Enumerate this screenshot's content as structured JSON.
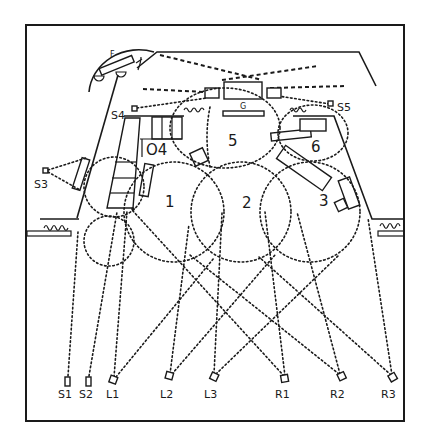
{
  "diagram": {
    "type": "stage lighting plot",
    "areas": [
      {
        "id": "1",
        "label": "1"
      },
      {
        "id": "2",
        "label": "2"
      },
      {
        "id": "3",
        "label": "3"
      },
      {
        "id": "4",
        "label": "O4"
      },
      {
        "id": "5",
        "label": "5"
      },
      {
        "id": "6",
        "label": "6"
      }
    ],
    "scenery_labels": {
      "F": "F",
      "G": "G"
    },
    "instruments": [
      {
        "id": "S1",
        "label": "S1"
      },
      {
        "id": "S2",
        "label": "S2"
      },
      {
        "id": "L1",
        "label": "L1"
      },
      {
        "id": "L2",
        "label": "L2"
      },
      {
        "id": "L3",
        "label": "L3"
      },
      {
        "id": "R1",
        "label": "R1"
      },
      {
        "id": "R2",
        "label": "R2"
      },
      {
        "id": "R3",
        "label": "R3"
      },
      {
        "id": "S3",
        "label": "S3"
      },
      {
        "id": "S4",
        "label": "S4"
      },
      {
        "id": "S5",
        "label": "S5"
      }
    ],
    "colors": {
      "ink": "#1a1a1a",
      "paper": "#ffffff"
    }
  }
}
